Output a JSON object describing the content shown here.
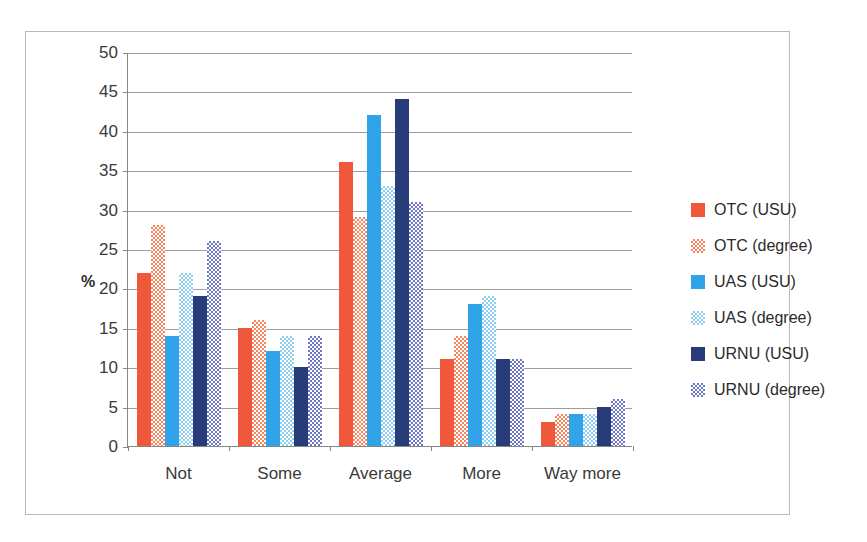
{
  "chart_data": {
    "type": "bar",
    "title": "",
    "xlabel": "",
    "ylabel": "%",
    "ylim": [
      0,
      50
    ],
    "ytick_step": 5,
    "yticks": [
      50,
      45,
      40,
      35,
      30,
      25,
      20,
      15,
      10,
      5,
      0
    ],
    "grid": true,
    "legend_position": "right",
    "categories": [
      "Not",
      "Some",
      "Average",
      "More",
      "Way more"
    ],
    "series": [
      {
        "name": "OTC (USU)",
        "color": "#F0583C",
        "pattern": "solid",
        "values": [
          22,
          15,
          36,
          11,
          3
        ]
      },
      {
        "name": "OTC (degree)",
        "color": "#F6865F",
        "pattern": "checkered",
        "values": [
          28,
          16,
          29,
          14,
          4
        ]
      },
      {
        "name": "UAS (USU)",
        "color": "#31A3E8",
        "pattern": "solid",
        "values": [
          14,
          12,
          42,
          18,
          4
        ]
      },
      {
        "name": "UAS (degree)",
        "color": "#8FD0F2",
        "pattern": "checkered",
        "values": [
          22,
          14,
          33,
          19,
          4
        ]
      },
      {
        "name": "URNU (USU)",
        "color": "#273C78",
        "pattern": "solid",
        "values": [
          19,
          10,
          44,
          11,
          5
        ]
      },
      {
        "name": "URNU (degree)",
        "color": "#6B77C4",
        "pattern": "checkered",
        "values": [
          26,
          14,
          31,
          11,
          6
        ]
      }
    ]
  }
}
